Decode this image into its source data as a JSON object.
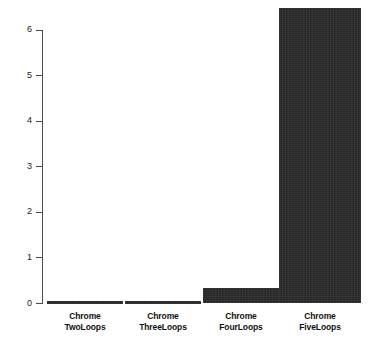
{
  "chart_data": {
    "type": "bar",
    "title": "",
    "subtitle": "",
    "xlabel": "",
    "ylabel": "",
    "categories": [
      "Chrome TwoLoops",
      "Chrome ThreeLoops",
      "Chrome FourLoops",
      "Chrome FiveLoops"
    ],
    "category_lines": [
      [
        "Chrome",
        "TwoLoops"
      ],
      [
        "Chrome",
        "ThreeLoops"
      ],
      [
        "Chrome",
        "FourLoops"
      ],
      [
        "Chrome",
        "FiveLoops"
      ]
    ],
    "values": [
      0.02,
      0.02,
      0.35,
      6.48
    ],
    "ylim": [
      0,
      6.5
    ],
    "yticks": [
      0,
      1,
      2,
      3,
      4,
      5,
      6
    ],
    "ytick_labels": [
      "0",
      "1",
      "2",
      "3",
      "4",
      "5",
      "6"
    ],
    "grid": false,
    "legend": null,
    "legend_position": "none",
    "bar_color": "#2a2a2a",
    "axis_color": "#4d4d4d",
    "background_color": "#ffffff",
    "text_color": "#111111"
  },
  "axis": {
    "y_tick_0": "0",
    "y_tick_1": "1",
    "y_tick_2": "2",
    "y_tick_3": "3",
    "y_tick_4": "4",
    "y_tick_5": "5",
    "y_tick_6": "6"
  },
  "bars": [
    {
      "label_line1": "Chrome",
      "label_line2": "TwoLoops",
      "value": 0.02
    },
    {
      "label_line1": "Chrome",
      "label_line2": "ThreeLoops",
      "value": 0.02
    },
    {
      "label_line1": "Chrome",
      "label_line2": "FourLoops",
      "value": 0.35
    },
    {
      "label_line1": "Chrome",
      "label_line2": "FiveLoops",
      "value": 6.48
    }
  ]
}
